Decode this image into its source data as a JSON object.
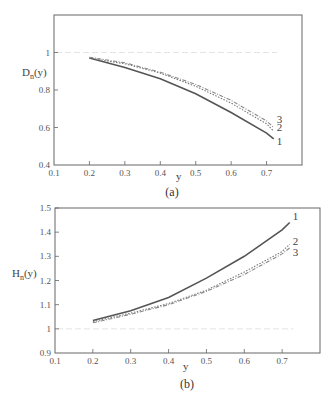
{
  "chart_data": [
    {
      "type": "line",
      "panel": "(a)",
      "title": "",
      "xlabel": "y",
      "ylabel": "D_n(y)",
      "xlim": [
        0.1,
        0.8
      ],
      "ylim": [
        0.4,
        1.2
      ],
      "xticks": [
        "0.1",
        "0.2",
        "0.3",
        "0.4",
        "0.5",
        "0.6",
        "0.7"
      ],
      "yticks": [
        "0.4",
        "0.6",
        "0.8",
        "1"
      ],
      "reference_line": 1.0,
      "x": [
        0.2,
        0.3,
        0.4,
        0.5,
        0.6,
        0.7,
        0.72
      ],
      "series": [
        {
          "name": "1",
          "style": "solid",
          "values": [
            0.97,
            0.92,
            0.86,
            0.78,
            0.68,
            0.57,
            0.54
          ]
        },
        {
          "name": "2",
          "style": "dotted",
          "values": [
            0.97,
            0.94,
            0.89,
            0.82,
            0.73,
            0.62,
            0.58
          ]
        },
        {
          "name": "3",
          "style": "dash-dot",
          "values": [
            0.975,
            0.945,
            0.895,
            0.83,
            0.745,
            0.635,
            0.6
          ]
        }
      ],
      "caption": "(a)"
    },
    {
      "type": "line",
      "panel": "(b)",
      "title": "",
      "xlabel": "y",
      "ylabel": "H_n(y)",
      "xlim": [
        0.1,
        0.8
      ],
      "ylim": [
        0.9,
        1.5
      ],
      "xticks": [
        "0.1",
        "0.2",
        "0.3",
        "0.4",
        "0.5",
        "0.6",
        "0.7"
      ],
      "yticks": [
        "0.9",
        "1",
        "1.1",
        "1.2",
        "1.3",
        "1.4",
        "1.5"
      ],
      "reference_line": 1.0,
      "x": [
        0.2,
        0.3,
        0.4,
        0.5,
        0.6,
        0.7,
        0.72
      ],
      "series": [
        {
          "name": "1",
          "style": "solid",
          "values": [
            1.035,
            1.075,
            1.13,
            1.21,
            1.3,
            1.41,
            1.44
          ]
        },
        {
          "name": "2",
          "style": "dotted",
          "values": [
            1.03,
            1.065,
            1.105,
            1.16,
            1.235,
            1.32,
            1.35
          ]
        },
        {
          "name": "3",
          "style": "dash-dot",
          "values": [
            1.025,
            1.06,
            1.1,
            1.155,
            1.225,
            1.31,
            1.335
          ]
        }
      ],
      "caption": "(b)"
    }
  ]
}
